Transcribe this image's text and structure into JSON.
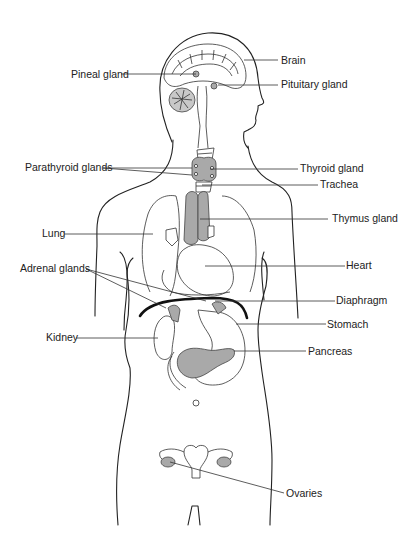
{
  "diagram": {
    "labels": {
      "brain": "Brain",
      "pineal_gland": "Pineal gland",
      "pituitary_gland": "Pituitary gland",
      "parathyroid_glands": "Parathyroid glands",
      "thyroid_gland": "Thyroid gland",
      "trachea": "Trachea",
      "thymus_gland": "Thymus gland",
      "lung": "Lung",
      "heart": "Heart",
      "adrenal_glands": "Adrenal glands",
      "diaphragm": "Diaphragm",
      "stomach": "Stomach",
      "kidney": "Kidney",
      "pancreas": "Pancreas",
      "ovaries": "Ovaries"
    },
    "colors": {
      "outline": "#222222",
      "gland_fill": "#a9a9a9",
      "background": "#ffffff"
    }
  }
}
